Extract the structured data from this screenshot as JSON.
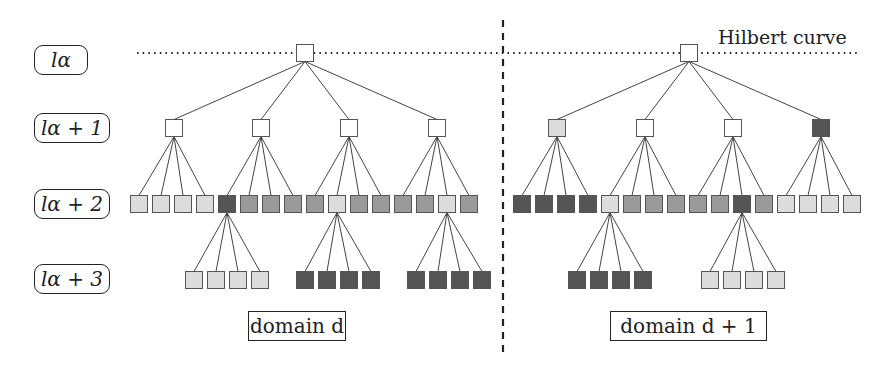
{
  "levels": [
    {
      "label": "lα",
      "y": 60
    },
    {
      "label": "lα + 1",
      "y": 128
    },
    {
      "label": "lα + 2",
      "y": 204
    },
    {
      "label": "lα + 3",
      "y": 279
    }
  ],
  "curve_label": "Hilbert curve",
  "domains": [
    {
      "label": "domain d",
      "x": 248,
      "w": 98
    },
    {
      "label": "domain d + 1",
      "x": 610,
      "w": 157
    }
  ],
  "colors": {
    "white": "#ffffff",
    "light": "#dcdcdc",
    "mid": "#9a9a9a",
    "dark": "#555555",
    "stroke": "#555555"
  },
  "tree": {
    "box_size": 17,
    "roots": [
      {
        "x": 305,
        "y": 53,
        "shade": "white",
        "children": [
          {
            "x": 174,
            "shade": "white",
            "children": [
              {
                "x": 139,
                "shade": "light"
              },
              {
                "x": 161,
                "shade": "light"
              },
              {
                "x": 183,
                "shade": "light"
              },
              {
                "x": 205,
                "shade": "light"
              }
            ]
          },
          {
            "x": 261,
            "shade": "white",
            "children": [
              {
                "x": 227,
                "shade": "dark",
                "children": [
                  {
                    "x": 194,
                    "shade": "light"
                  },
                  {
                    "x": 216,
                    "shade": "light"
                  },
                  {
                    "x": 238,
                    "shade": "light"
                  },
                  {
                    "x": 260,
                    "shade": "light"
                  }
                ]
              },
              {
                "x": 249,
                "shade": "mid"
              },
              {
                "x": 271,
                "shade": "mid"
              },
              {
                "x": 293,
                "shade": "mid"
              }
            ]
          },
          {
            "x": 349,
            "shade": "white",
            "children": [
              {
                "x": 315,
                "shade": "mid"
              },
              {
                "x": 337,
                "shade": "light",
                "children": [
                  {
                    "x": 305,
                    "shade": "dark"
                  },
                  {
                    "x": 327,
                    "shade": "dark"
                  },
                  {
                    "x": 349,
                    "shade": "dark"
                  },
                  {
                    "x": 371,
                    "shade": "dark"
                  }
                ]
              },
              {
                "x": 359,
                "shade": "mid"
              },
              {
                "x": 381,
                "shade": "mid"
              }
            ]
          },
          {
            "x": 437,
            "shade": "white",
            "children": [
              {
                "x": 403,
                "shade": "mid"
              },
              {
                "x": 425,
                "shade": "mid"
              },
              {
                "x": 447,
                "shade": "light",
                "children": [
                  {
                    "x": 416,
                    "shade": "dark"
                  },
                  {
                    "x": 438,
                    "shade": "dark"
                  },
                  {
                    "x": 460,
                    "shade": "dark"
                  },
                  {
                    "x": 482,
                    "shade": "dark"
                  }
                ]
              },
              {
                "x": 469,
                "shade": "mid"
              }
            ]
          }
        ]
      },
      {
        "x": 689,
        "y": 53,
        "shade": "white",
        "children": [
          {
            "x": 557,
            "shade": "light",
            "children": [
              {
                "x": 522,
                "shade": "dark"
              },
              {
                "x": 544,
                "shade": "dark"
              },
              {
                "x": 566,
                "shade": "dark"
              },
              {
                "x": 588,
                "shade": "dark"
              }
            ]
          },
          {
            "x": 645,
            "shade": "white",
            "children": [
              {
                "x": 610,
                "shade": "light",
                "children": [
                  {
                    "x": 577,
                    "shade": "dark"
                  },
                  {
                    "x": 599,
                    "shade": "dark"
                  },
                  {
                    "x": 621,
                    "shade": "dark"
                  },
                  {
                    "x": 643,
                    "shade": "dark"
                  }
                ]
              },
              {
                "x": 632,
                "shade": "mid"
              },
              {
                "x": 654,
                "shade": "mid"
              },
              {
                "x": 676,
                "shade": "mid"
              }
            ]
          },
          {
            "x": 733,
            "shade": "white",
            "children": [
              {
                "x": 698,
                "shade": "mid"
              },
              {
                "x": 720,
                "shade": "mid"
              },
              {
                "x": 742,
                "shade": "dark",
                "children": [
                  {
                    "x": 710,
                    "shade": "light"
                  },
                  {
                    "x": 732,
                    "shade": "light"
                  },
                  {
                    "x": 754,
                    "shade": "light"
                  },
                  {
                    "x": 776,
                    "shade": "light"
                  }
                ]
              },
              {
                "x": 764,
                "shade": "mid"
              }
            ]
          },
          {
            "x": 821,
            "shade": "dark",
            "children": [
              {
                "x": 786,
                "shade": "light"
              },
              {
                "x": 808,
                "shade": "light"
              },
              {
                "x": 830,
                "shade": "light"
              },
              {
                "x": 852,
                "shade": "light"
              }
            ]
          }
        ]
      }
    ],
    "level_y": [
      53,
      128,
      204,
      280
    ]
  },
  "lines": {
    "hilbert_dotted": {
      "x1": 137,
      "x2": 858,
      "y": 53
    },
    "domain_divider": {
      "x": 503,
      "y1": 20,
      "y2": 356
    }
  }
}
